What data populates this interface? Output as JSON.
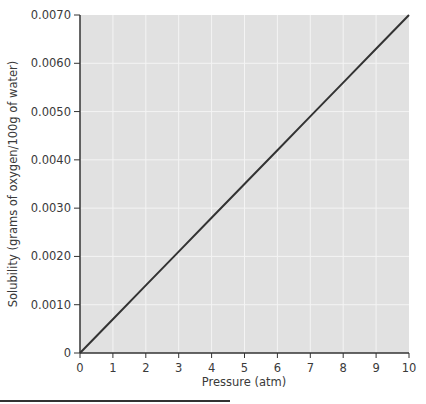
{
  "chart_data": {
    "type": "line",
    "title": "",
    "xlabel": "Pressure (atm)",
    "ylabel": "Solubility (grams of oxygen/100g of water)",
    "xlim": [
      0,
      10
    ],
    "ylim": [
      0,
      0.007
    ],
    "grid": true,
    "legend": null,
    "x_ticks": [
      "0",
      "1",
      "2",
      "3",
      "4",
      "5",
      "6",
      "7",
      "8",
      "9",
      "10"
    ],
    "y_ticks": [
      "0",
      "0.0010",
      "0.0020",
      "0.0030",
      "0.0040",
      "0.0050",
      "0.0060",
      "0.0070"
    ],
    "series": [
      {
        "name": "Oxygen solubility",
        "x": [
          0,
          1,
          2,
          3,
          4,
          5,
          6,
          7,
          8,
          9,
          10
        ],
        "values": [
          0,
          0.0007,
          0.0014,
          0.0021,
          0.0028,
          0.0035,
          0.0042,
          0.0049,
          0.0056,
          0.0063,
          0.007
        ]
      }
    ]
  },
  "colors": {
    "plot_bg": "#e1e1e1",
    "grid": "#f4f4f4",
    "line": "#333333",
    "axis": "#333333"
  }
}
